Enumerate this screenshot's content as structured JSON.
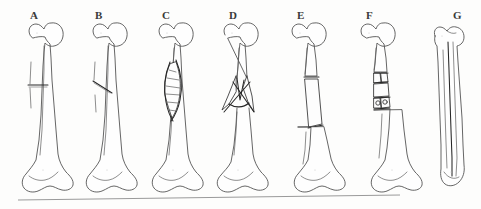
{
  "figure": {
    "background_color": "#fdfdfc",
    "ink_color": "#4a4a4a",
    "fracture_ink_color": "#262626",
    "label_color": "#3a3a3a",
    "baseline_color": "#9a9a9a",
    "width": 481,
    "height": 209
  },
  "panels": [
    {
      "label": "A",
      "label_x": 30,
      "label_y": 10,
      "bone_x": 44,
      "fracture_type": "transverse",
      "description": "Transverse fracture of the femoral shaft with a single horizontal break line, no displacement"
    },
    {
      "label": "B",
      "label_x": 95,
      "label_y": 10,
      "bone_x": 108,
      "fracture_type": "oblique",
      "description": "Short oblique fracture of the femoral shaft, angled break line, minimal displacement"
    },
    {
      "label": "C",
      "label_x": 162,
      "label_y": 10,
      "bone_x": 174,
      "fracture_type": "spiral",
      "description": "Long spiral fracture of the femoral shaft with elongated twisting break line"
    },
    {
      "label": "D",
      "label_x": 229,
      "label_y": 10,
      "bone_x": 239,
      "fracture_type": "comminuted-butterfly",
      "description": "Comminuted fracture with crossing butterfly wedge fragments at the proximal shaft"
    },
    {
      "label": "E",
      "label_x": 297,
      "label_y": 10,
      "bone_x": 307,
      "fracture_type": "segmental-displaced",
      "description": "Segmental fracture with a displaced intermediate shaft segment offset laterally"
    },
    {
      "label": "F",
      "label_x": 366,
      "label_y": 10,
      "bone_x": 376,
      "fracture_type": "comminuted-fragmented",
      "description": "Severely comminuted fracture with multiple small bone fragments at two levels"
    },
    {
      "label": "G",
      "label_x": 453,
      "label_y": 10,
      "bone_x": 448,
      "fracture_type": "longitudinal",
      "description": "Longitudinal fracture splitting the femur along the full length of the shaft"
    }
  ],
  "baseline": {
    "name": "ground-line",
    "x1": 18,
    "y1": 200,
    "x2": 400,
    "y2": 195
  }
}
